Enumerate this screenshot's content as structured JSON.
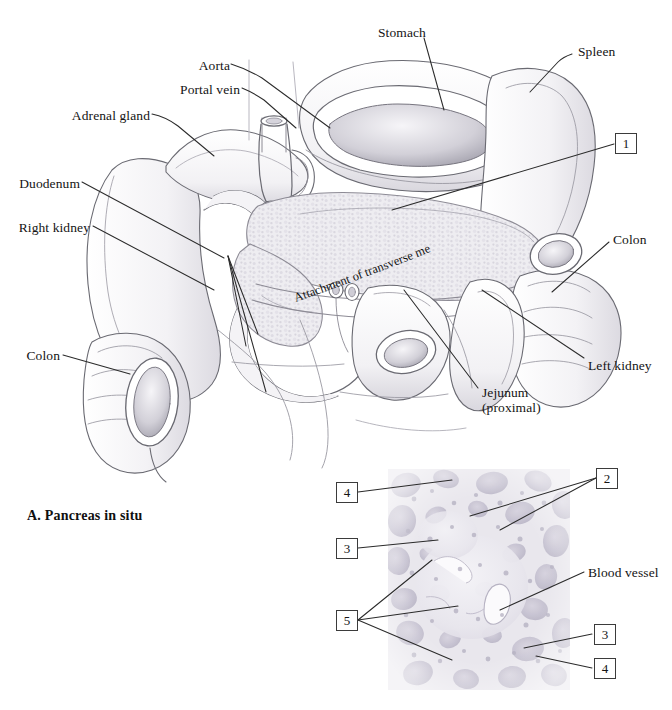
{
  "plate": {
    "panel_a_caption": "A. Pancreas in situ",
    "curved_label": "Attachment of transverse mesocolon"
  },
  "anatomy_labels": [
    {
      "id": "aorta",
      "text": "Aorta",
      "side": "right"
    },
    {
      "id": "portal-vein",
      "text": "Portal vein",
      "side": "right"
    },
    {
      "id": "adrenal-gland",
      "text": "Adrenal gland",
      "side": "right"
    },
    {
      "id": "duodenum",
      "text": "Duodenum",
      "side": "right"
    },
    {
      "id": "right-kidney",
      "text": "Right kidney",
      "side": "right"
    },
    {
      "id": "colon-left",
      "text": "Colon",
      "side": "right"
    },
    {
      "id": "stomach",
      "text": "Stomach",
      "side": "left"
    },
    {
      "id": "spleen",
      "text": "Spleen",
      "side": "left"
    },
    {
      "id": "colon-right",
      "text": "Colon",
      "side": "left"
    },
    {
      "id": "left-kidney",
      "text": "Left kidney",
      "side": "left"
    },
    {
      "id": "jejunum",
      "text": "Jejunum",
      "side": "left"
    },
    {
      "id": "jejunum-sub",
      "text": "(proximal)",
      "side": "left"
    }
  ],
  "anatomy_numbers": [
    {
      "id": "anatomy-num-1",
      "value": "1"
    }
  ],
  "histology_labels": [
    {
      "id": "blood-vessel",
      "text": "Blood vessel"
    }
  ],
  "histology_numbers": [
    {
      "id": "histo-num-4-top",
      "value": "4"
    },
    {
      "id": "histo-num-3-upper",
      "value": "3"
    },
    {
      "id": "histo-num-5",
      "value": "5"
    },
    {
      "id": "histo-num-2",
      "value": "2"
    },
    {
      "id": "histo-num-3-lower",
      "value": "3"
    },
    {
      "id": "histo-num-4-bottom",
      "value": "4"
    }
  ],
  "colors": {
    "ink": "#141414",
    "leader": "#3b3b3b",
    "organ_outline": "#6a6a72",
    "organ_fill": "#ffffff",
    "pancreas_tint": "#ecebee",
    "micrograph_base": "#e7e5ea",
    "micrograph_cell": "#c8c5d0"
  }
}
